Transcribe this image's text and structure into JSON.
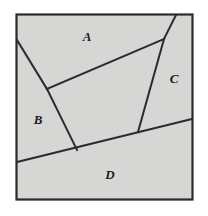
{
  "figure": {
    "name": "partitioned-square-diagram",
    "background_color": "#ffffff",
    "panel_fill": "#d6d6d4",
    "border_color": "#2b2b2b",
    "line_color": "#2b2b2b",
    "panel": {
      "x": 16,
      "y": 14,
      "width": 177,
      "height": 186
    },
    "labels": [
      {
        "id": "A",
        "text": "A",
        "x": 87,
        "y": 38
      },
      {
        "id": "B",
        "text": "B",
        "x": 38,
        "y": 121
      },
      {
        "id": "C",
        "text": "C",
        "x": 174,
        "y": 80
      },
      {
        "id": "D",
        "text": "D",
        "x": 110,
        "y": 176
      }
    ],
    "segments": [
      {
        "id": "line-b-upper",
        "name": "segment-left-edge-to-vertex",
        "x1": 17,
        "y1": 40,
        "x2": 47,
        "y2": 89
      },
      {
        "id": "line-b-lower",
        "name": "segment-vertex-to-baseline",
        "x1": 47,
        "y1": 89,
        "x2": 77,
        "y2": 150
      },
      {
        "id": "line-a",
        "name": "segment-vertex-to-right-apex",
        "x1": 47,
        "y1": 89,
        "x2": 164,
        "y2": 39
      },
      {
        "id": "line-c-upper",
        "name": "segment-apex-to-top-edge",
        "x1": 164,
        "y1": 39,
        "x2": 176,
        "y2": 15
      },
      {
        "id": "line-c-lower",
        "name": "segment-apex-to-baseline",
        "x1": 164,
        "y1": 39,
        "x2": 138,
        "y2": 132
      },
      {
        "id": "line-d",
        "name": "segment-baseline-across",
        "x1": 17,
        "y1": 162,
        "x2": 192,
        "y2": 119
      }
    ]
  }
}
